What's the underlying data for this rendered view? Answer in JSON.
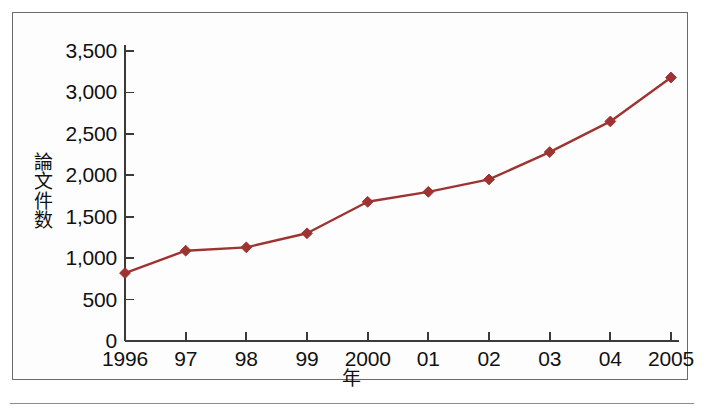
{
  "chart_data": {
    "type": "line",
    "title": "",
    "subtitle": "",
    "xlabel": "年",
    "ylabel": "論文件数",
    "categories": [
      "1996",
      "97",
      "98",
      "99",
      "2000",
      "01",
      "02",
      "03",
      "04",
      "2005"
    ],
    "values": [
      820,
      1090,
      1130,
      1300,
      1680,
      1800,
      1950,
      2280,
      2650,
      3180
    ],
    "series": [
      {
        "name": "論文件数",
        "values": [
          820,
          1090,
          1130,
          1300,
          1680,
          1800,
          1950,
          2280,
          2650,
          3180
        ]
      }
    ],
    "x_tick_labels": [
      "1996",
      "97",
      "98",
      "99",
      "2000",
      "01",
      "02",
      "03",
      "04",
      "2005"
    ],
    "y_tick_labels": [
      "0",
      "500",
      "1,000",
      "1,500",
      "2,000",
      "2,500",
      "3,000",
      "3,500"
    ],
    "y_tick_values": [
      0,
      500,
      1000,
      1500,
      2000,
      2500,
      3000,
      3500
    ],
    "ylim": [
      0,
      3500
    ],
    "grid": false,
    "legend": "none",
    "marker": "diamond",
    "line_color": "#9e3432",
    "marker_color": "#9e3432",
    "axis_color": "#3a3a3a",
    "frame_color": "#6a6a6a"
  },
  "figure": {
    "border_color": "#6a6a6a",
    "background": "#ffffff"
  }
}
